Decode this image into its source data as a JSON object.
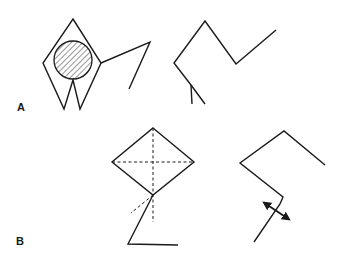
{
  "figure": {
    "panels": [
      {
        "label": "A",
        "description": "Upper row: diamond-shaped figure with hatched circle and two legs, plus an angular line arm; separate zig-zag stick figure"
      },
      {
        "label": "B",
        "description": "Lower row: diamond with dashed cross-axes and a bent leg; separate zig-zag figure with double-headed rotation arrow"
      }
    ],
    "colors": {
      "stroke": "#1a1a1a",
      "background": "#ffffff"
    }
  }
}
